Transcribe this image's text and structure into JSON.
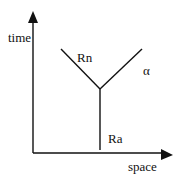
{
  "diagram": {
    "type": "spacetime-decay",
    "axes": {
      "vertical_label": "time",
      "horizontal_label": "space"
    },
    "particles": {
      "incoming": "Ra",
      "outgoing_left": "Rn",
      "outgoing_right": "α"
    },
    "colors": {
      "line": "#111111",
      "background": "#ffffff"
    }
  }
}
